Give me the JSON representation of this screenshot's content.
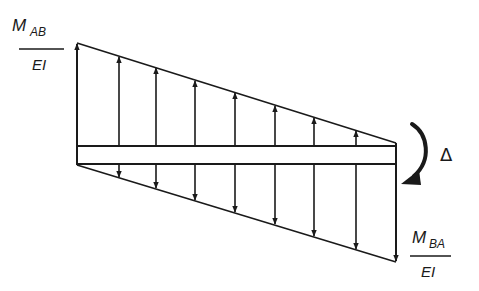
{
  "diagram": {
    "type": "moment-diagram-beam",
    "labels": {
      "left_moment": {
        "numerator": "M",
        "subscript": "AB",
        "denominator": "EI"
      },
      "right_moment": {
        "numerator": "M",
        "subscript": "BA",
        "denominator": "EI"
      },
      "rotation": "Δ"
    },
    "beam": {
      "x_start": 77,
      "x_end": 396,
      "y_top": 146,
      "y_bottom": 164
    },
    "top_line": {
      "x1": 77,
      "y1": 43,
      "x2": 396,
      "y2": 143
    },
    "bottom_line": {
      "x1": 77,
      "y1": 165,
      "x2": 396,
      "y2": 262
    },
    "arrow_x_positions": [
      119,
      156,
      195,
      235,
      275,
      314,
      356
    ],
    "upward_arrows_count": 8,
    "downward_arrows_count": 8,
    "colors": {
      "line": "#1a1a1a",
      "background": "#ffffff"
    }
  }
}
